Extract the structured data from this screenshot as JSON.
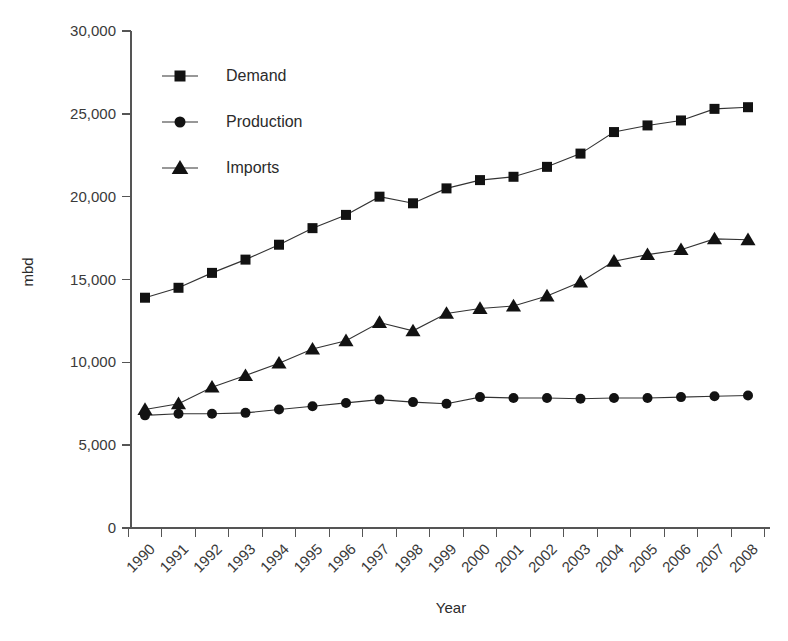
{
  "chart_data": {
    "type": "line",
    "title": "",
    "xlabel": "Year",
    "ylabel": "mbd",
    "ylim": [
      0,
      30000
    ],
    "grid": false,
    "legend_position": "upper-left-inside",
    "categories": [
      "1990",
      "1991",
      "1992",
      "1993",
      "1994",
      "1995",
      "1996",
      "1997",
      "1998",
      "1999",
      "2000",
      "2001",
      "2002",
      "2003",
      "2004",
      "2005",
      "2006",
      "2007",
      "2008"
    ],
    "y_ticks": [
      0,
      5000,
      10000,
      15000,
      20000,
      25000,
      30000
    ],
    "y_tick_labels": [
      "0",
      "5,000",
      "10,000",
      "15,000",
      "20,000",
      "25,000",
      "30,000"
    ],
    "series": [
      {
        "name": "Demand",
        "marker": "square",
        "values": [
          13900,
          14500,
          15400,
          16200,
          17100,
          18100,
          18900,
          20000,
          19600,
          20500,
          21000,
          21200,
          21800,
          22600,
          23900,
          24300,
          24600,
          25300,
          25400
        ]
      },
      {
        "name": "Production",
        "marker": "circle",
        "values": [
          6800,
          6900,
          6900,
          6950,
          7150,
          7350,
          7550,
          7750,
          7600,
          7500,
          7900,
          7850,
          7850,
          7800,
          7850,
          7850,
          7900,
          7950,
          8000
        ]
      },
      {
        "name": "Imports",
        "marker": "triangle",
        "values": [
          7150,
          7500,
          8500,
          9200,
          9950,
          10800,
          11300,
          12400,
          11900,
          12950,
          13250,
          13400,
          14000,
          14850,
          16100,
          16500,
          16800,
          17450,
          17400
        ]
      }
    ]
  },
  "legend": {
    "entries": [
      {
        "label": "Demand",
        "marker": "square"
      },
      {
        "label": "Production",
        "marker": "circle"
      },
      {
        "label": "Imports",
        "marker": "triangle"
      }
    ]
  },
  "axes": {
    "x_title": "Year",
    "y_title": "mbd"
  }
}
